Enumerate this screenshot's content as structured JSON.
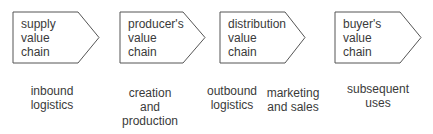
{
  "diagram": {
    "colors": {
      "outline": "#555555",
      "text": "#3a3a3a",
      "background": "#ffffff"
    },
    "stages": [
      {
        "label": "supply\nvalue\nchain"
      },
      {
        "label": "producer's\nvalue\nchain"
      },
      {
        "label": "distribution\nvalue\nchain"
      },
      {
        "label": "buyer's\nvalue\nchain"
      }
    ],
    "activities": [
      {
        "label": "inbound\nlogistics"
      },
      {
        "label": "creation\nand\nproduction"
      },
      {
        "label": "outbound\nlogistics"
      },
      {
        "label": "marketing\nand sales"
      },
      {
        "label": "subsequent\nuses"
      }
    ]
  }
}
